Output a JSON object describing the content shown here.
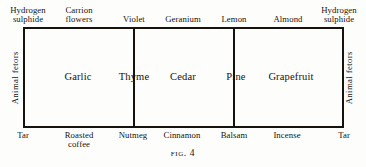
{
  "figure": {
    "caption_prefix": "Fig.",
    "caption_number": "4"
  },
  "diagram": {
    "type": "odour-prism",
    "cells": [
      {
        "id": "cell-1",
        "label": "Garlic"
      },
      {
        "id": "cell-2",
        "label": "Thyme"
      },
      {
        "id": "cell-3",
        "label": "Cedar"
      },
      {
        "id": "cell-4",
        "label": "Pine"
      },
      {
        "id": "cell-5",
        "label": "Grapefruit"
      }
    ],
    "top_labels": [
      {
        "id": "top-1",
        "line1": "Hydrogen",
        "line2": "sulphide"
      },
      {
        "id": "top-2",
        "line1": "Carrion",
        "line2": "flowers"
      },
      {
        "id": "top-3",
        "line1": "Violet",
        "line2": ""
      },
      {
        "id": "top-4",
        "line1": "Geranium",
        "line2": ""
      },
      {
        "id": "top-5",
        "line1": "Lemon",
        "line2": ""
      },
      {
        "id": "top-6",
        "line1": "Almond",
        "line2": ""
      },
      {
        "id": "top-7",
        "line1": "Hydrogen",
        "line2": "sulphide"
      }
    ],
    "bottom_labels": [
      {
        "id": "bottom-1",
        "line1": "Tar",
        "line2": ""
      },
      {
        "id": "bottom-2",
        "line1": "Roasted",
        "line2": "coffee"
      },
      {
        "id": "bottom-3",
        "line1": "Nutmeg",
        "line2": ""
      },
      {
        "id": "bottom-4",
        "line1": "Cinnamon",
        "line2": ""
      },
      {
        "id": "bottom-5",
        "line1": "Balsam",
        "line2": ""
      },
      {
        "id": "bottom-6",
        "line1": "Incense",
        "line2": ""
      },
      {
        "id": "bottom-7",
        "line1": "Tar",
        "line2": ""
      }
    ],
    "side_labels": [
      {
        "id": "side-left",
        "label": "Animal fetors"
      },
      {
        "id": "side-right",
        "label": "Animal fetors"
      }
    ],
    "colors": {
      "ink": "#16130f",
      "paper": "#fdfdfc"
    }
  }
}
